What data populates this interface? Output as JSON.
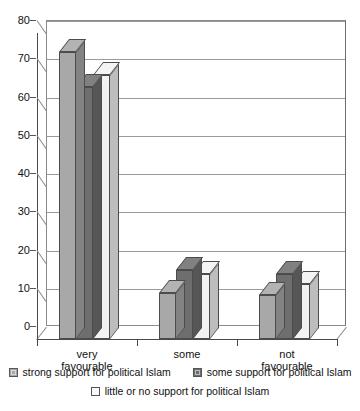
{
  "chart_data": {
    "type": "bar",
    "title": "",
    "subtitle": "",
    "xlabel": "",
    "ylabel": "",
    "categories": [
      "very favourable",
      "some",
      "not favourable"
    ],
    "category_lines": [
      [
        "very",
        "favourable"
      ],
      [
        "some"
      ],
      [
        "not",
        "favourable"
      ]
    ],
    "series": [
      {
        "name": "strong support for political Islam",
        "color": "#a8a8a8",
        "values": [
          75,
          12,
          11.5
        ]
      },
      {
        "name": "some support for political Islam",
        "color": "#6e6e6e",
        "values": [
          66,
          18,
          17
        ]
      },
      {
        "name": "little or no support for political Islam",
        "color": "#f2f2f2",
        "values": [
          69,
          17,
          14.5
        ]
      }
    ],
    "ylim": [
      0,
      80
    ],
    "yticks": [
      0,
      10,
      20,
      30,
      40,
      50,
      60,
      70,
      80
    ],
    "ytick_labels": [
      "0",
      "10",
      "20",
      "30",
      "40",
      "50",
      "60",
      "70",
      "80"
    ],
    "grid": true,
    "grid_axis": "y",
    "legend_position": "bottom",
    "three_d": true,
    "axis_color": "#4a4a4a",
    "grid_color": "#9a9a9a",
    "background": "#ffffff"
  }
}
